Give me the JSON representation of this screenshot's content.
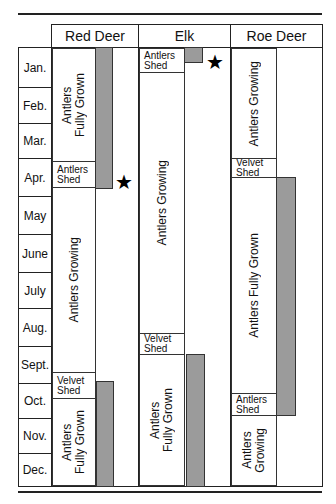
{
  "months": [
    "Jan.",
    "Feb.",
    "Mar.",
    "Apr.",
    "May",
    "June",
    "July",
    "Aug.",
    "Sept.",
    "Oct.",
    "Nov.",
    "Dec."
  ],
  "species": {
    "red_deer": {
      "name": "Red Deer",
      "segments": [
        {
          "label_line1": "Antlers",
          "label_line2": "Fully Grown",
          "start_month": "Jan.",
          "end_month": "Apr."
        },
        {
          "label_line1": "Antlers",
          "label_line2": "Shed",
          "month": "Apr."
        },
        {
          "label": "Antlers Growing",
          "start_month": "Apr.",
          "end_month": "Sept."
        },
        {
          "label_line1": "Velvet",
          "label_line2": "Shed",
          "month": "Sept./Oct."
        },
        {
          "label_line1": "Antlers",
          "label_line2": "Fully Grown",
          "start_month": "Oct.",
          "end_month": "Dec."
        }
      ],
      "gray_bars": [
        {
          "start_month": "Jan.",
          "end_month": "Apr."
        },
        {
          "start_month": "Oct.",
          "end_month": "Dec."
        }
      ],
      "star_month": "Apr."
    },
    "elk": {
      "name": "Elk",
      "segments": [
        {
          "label_line1": "Antlers",
          "label_line2": "Shed",
          "month": "Jan."
        },
        {
          "label": "Antlers Growing",
          "start_month": "Jan.",
          "end_month": "Aug."
        },
        {
          "label_line1": "Velvet",
          "label_line2": "Shed",
          "month": "Aug."
        },
        {
          "label_line1": "Antlers",
          "label_line2": "Fully Grown",
          "start_month": "Sept.",
          "end_month": "Dec."
        }
      ],
      "gray_bars": [
        {
          "start_month": "Jan.",
          "end_month": "Jan."
        },
        {
          "start_month": "Sept.",
          "end_month": "Dec."
        }
      ],
      "star_month": "Jan."
    },
    "roe_deer": {
      "name": "Roe Deer",
      "segments": [
        {
          "label": "Antlers Growing",
          "start_month": "Jan.",
          "end_month": "Mar."
        },
        {
          "label_line1": "Velvet",
          "label_line2": "Shed",
          "month": "Apr."
        },
        {
          "label": "Antlers Fully Grown",
          "start_month": "Apr.",
          "end_month": "Oct."
        },
        {
          "label_line1": "Antlers",
          "label_line2": "Shed",
          "month": "Oct."
        },
        {
          "label_line1": "Antlers",
          "label_line2": "Growing",
          "start_month": "Nov.",
          "end_month": "Dec."
        }
      ],
      "gray_bars": [
        {
          "start_month": "Apr.",
          "end_month": "Oct."
        }
      ]
    }
  },
  "legend": {
    "star_symbol": "★",
    "bar_color": "#9b9b9b"
  }
}
